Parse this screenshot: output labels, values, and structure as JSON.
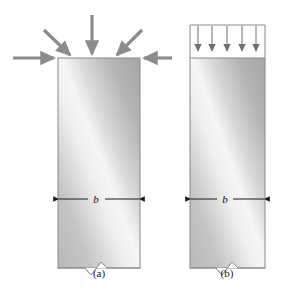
{
  "figure": {
    "background_color": "#ffffff",
    "panels": [
      {
        "id": "a",
        "caption": "(a)",
        "caption_x": 99,
        "caption_y": 276,
        "column": {
          "name": "column-body",
          "x": 58,
          "y": 58,
          "width": 82,
          "height": 210,
          "outline_color": "#8a8a8a",
          "fill_light": "#f2f2f2",
          "fill_mid": "#c9c9c9",
          "fill_dark": "#a8a8a8"
        },
        "dimension": {
          "label": "b",
          "label_x": 96,
          "label_y": 196,
          "y": 199,
          "x_start": 58,
          "x_end": 140,
          "color": "#1a1a1a"
        },
        "break_notch": {
          "name": "break-notch",
          "center_x": 96,
          "y": 268,
          "width": 22,
          "depth": 9
        },
        "load_type": "concentrated-arrows",
        "arrow_color": "#8c8c8c",
        "arrow_stroke_width": 3.2,
        "arrows": [
          {
            "name": "load-arrow-horizontal-left",
            "x1": 13,
            "y1": 58,
            "x2": 57,
            "y2": 58
          },
          {
            "name": "load-arrow-diagonal-left",
            "x1": 44,
            "y1": 30,
            "x2": 72,
            "y2": 57
          },
          {
            "name": "load-arrow-vertical-center",
            "x1": 92,
            "y1": 15,
            "x2": 92,
            "y2": 57
          },
          {
            "name": "load-arrow-diagonal-right",
            "x1": 142,
            "y1": 30,
            "x2": 115,
            "y2": 57
          },
          {
            "name": "load-arrow-horizontal-right",
            "x1": 172,
            "y1": 58,
            "x2": 141,
            "y2": 58
          }
        ]
      },
      {
        "id": "b",
        "caption": "(b)",
        "caption_x": 227,
        "caption_y": 276,
        "column": {
          "name": "column-body",
          "x": 190,
          "y": 58,
          "width": 75,
          "height": 210,
          "outline_color": "#8a8a8a",
          "fill_light": "#f2f2f2",
          "fill_mid": "#c9c9c9",
          "fill_dark": "#a8a8a8"
        },
        "dimension": {
          "label": "b",
          "label_x": 224,
          "label_y": 196,
          "y": 199,
          "x_start": 190,
          "x_end": 265,
          "color": "#1a1a1a"
        },
        "break_notch": {
          "name": "break-notch",
          "center_x": 227,
          "y": 268,
          "width": 22,
          "depth": 9
        },
        "load_type": "distributed-arrows",
        "arrow_color": "#6f6f6f",
        "arrow_stroke_width": 1.0,
        "load_box": {
          "name": "distributed-load-box",
          "x": 190,
          "y": 25,
          "width": 75,
          "height": 33,
          "outline_color": "#8a8a8a"
        },
        "arrows": [
          {
            "name": "distributed-load-arrow-1",
            "x1": 198,
            "y1": 27,
            "x2": 198,
            "y2": 57
          },
          {
            "name": "distributed-load-arrow-2",
            "x1": 212,
            "y1": 27,
            "x2": 212,
            "y2": 57
          },
          {
            "name": "distributed-load-arrow-3",
            "x1": 227,
            "y1": 27,
            "x2": 227,
            "y2": 57
          },
          {
            "name": "distributed-load-arrow-4",
            "x1": 242,
            "y1": 27,
            "x2": 242,
            "y2": 57
          },
          {
            "name": "distributed-load-arrow-5",
            "x1": 256,
            "y1": 27,
            "x2": 256,
            "y2": 57
          }
        ]
      }
    ]
  }
}
